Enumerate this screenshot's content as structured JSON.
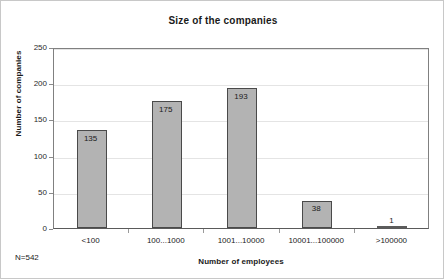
{
  "figure": {
    "note": "N=542",
    "background_color": "#ffffff",
    "border_color": "#c8c8c8"
  },
  "chart_data": {
    "type": "bar",
    "title": "Size of the companies",
    "xlabel": "Number of employees",
    "ylabel": "Number of companies",
    "categories": [
      "<100",
      "100...1000",
      "1001...10000",
      "10001...100000",
      ">100000"
    ],
    "values": [
      135,
      175,
      193,
      38,
      1
    ],
    "value_labels": [
      "135",
      "175",
      "193",
      "38",
      "1"
    ],
    "ylim": [
      0,
      250
    ],
    "yticks": [
      0,
      50,
      100,
      150,
      200,
      250
    ],
    "ytick_labels": [
      "0",
      "50",
      "100",
      "150",
      "200",
      "250"
    ],
    "grid": true,
    "legend": "none",
    "bar_color": "#b3b3b3",
    "bar_border_color": "#4a4a4a",
    "gridline_color": "#e4e4e4",
    "total_n": 542
  }
}
